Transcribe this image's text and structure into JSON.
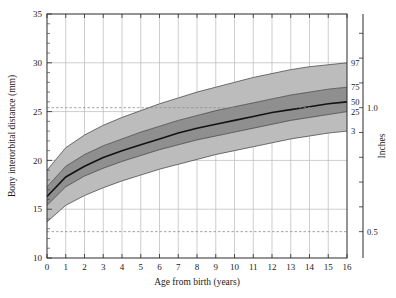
{
  "chart_data": {
    "type": "area",
    "title": "",
    "xlabel": "Age from birth (years)",
    "ylabel": "Bony interorbital distance (mm)",
    "y2label": "Inches",
    "xlim": [
      0,
      16
    ],
    "ylim": [
      10,
      35
    ],
    "grid": true,
    "legend_position": "right-inline",
    "x_ticks": [
      0,
      1,
      2,
      3,
      4,
      5,
      6,
      7,
      8,
      9,
      10,
      11,
      12,
      13,
      14,
      15,
      16
    ],
    "x_tick_labels": [
      "0",
      "1",
      "2",
      "3",
      "4",
      "5",
      "6",
      "7",
      "8",
      "9",
      "10",
      "11",
      "12",
      "13",
      "14",
      "15",
      "16"
    ],
    "y_ticks": [
      10,
      15,
      20,
      25,
      30,
      35
    ],
    "y_tick_labels": [
      "10",
      "15",
      "20",
      "25",
      "30",
      "35"
    ],
    "y2_ticks_mm": [
      12.7,
      15.24,
      17.78,
      20.32,
      22.86,
      25.4,
      27.94,
      30.48,
      33.02
    ],
    "y2_labeled": [
      {
        "mm": 25.4,
        "label": "1.0"
      },
      {
        "mm": 12.7,
        "label": "0.5"
      }
    ],
    "reference_lines": [
      {
        "mm": 25.4,
        "style": "dashed",
        "label": "1.0"
      },
      {
        "mm": 12.7,
        "style": "dashed",
        "label": "0.5"
      }
    ],
    "x": [
      0,
      1,
      2,
      3,
      4,
      5,
      6,
      7,
      8,
      9,
      10,
      11,
      12,
      13,
      14,
      15,
      16
    ],
    "series": [
      {
        "name": "97",
        "label": "97",
        "values": [
          19.0,
          21.3,
          22.6,
          23.6,
          24.4,
          25.1,
          25.8,
          26.4,
          27.0,
          27.5,
          28.0,
          28.5,
          28.9,
          29.3,
          29.6,
          29.8,
          30.0
        ]
      },
      {
        "name": "75",
        "label": "75",
        "values": [
          17.3,
          19.4,
          20.6,
          21.5,
          22.2,
          22.9,
          23.5,
          24.1,
          24.6,
          25.1,
          25.5,
          25.9,
          26.3,
          26.7,
          27.0,
          27.3,
          27.5
        ]
      },
      {
        "name": "50",
        "label": "50",
        "values": [
          16.3,
          18.3,
          19.4,
          20.3,
          21.0,
          21.6,
          22.2,
          22.8,
          23.3,
          23.7,
          24.1,
          24.5,
          24.9,
          25.2,
          25.5,
          25.8,
          26.0
        ]
      },
      {
        "name": "25",
        "label": "25",
        "values": [
          15.4,
          17.3,
          18.4,
          19.2,
          19.9,
          20.5,
          21.1,
          21.6,
          22.1,
          22.5,
          22.9,
          23.3,
          23.7,
          24.1,
          24.4,
          24.7,
          25.0
        ]
      },
      {
        "name": "3",
        "label": "3",
        "values": [
          13.7,
          15.4,
          16.4,
          17.2,
          17.9,
          18.5,
          19.1,
          19.6,
          20.1,
          20.6,
          21.0,
          21.4,
          21.8,
          22.2,
          22.5,
          22.8,
          23.0
        ]
      }
    ],
    "bands": [
      {
        "name": "3-25",
        "lower": "3",
        "upper": "25",
        "shade": "#bcbcbc"
      },
      {
        "name": "25-75",
        "lower": "25",
        "upper": "75",
        "shade": "#8f8f8f"
      },
      {
        "name": "75-97",
        "lower": "75",
        "upper": "97",
        "shade": "#bcbcbc"
      }
    ],
    "percentile_annotations": [
      "97",
      "75",
      "50",
      "25",
      "3"
    ],
    "colors": {
      "band_outer": "#bcbcbc",
      "band_inner": "#8f8f8f",
      "median": "#121212",
      "grid": "#b9b9b9",
      "axis": "#2b2b2b",
      "refline": "#8d8d8d"
    }
  }
}
